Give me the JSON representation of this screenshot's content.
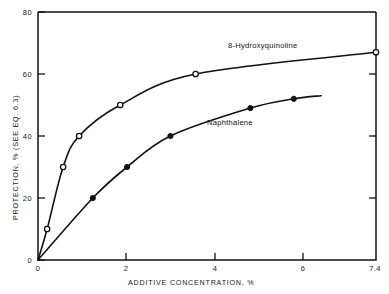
{
  "chart_data": {
    "type": "line",
    "title": "",
    "xlabel": "ADDITIVE CONCENTRATION, %",
    "ylabel": "PROTECTION, % (SEE EQ. 6.3)",
    "xlim": [
      0,
      7.4
    ],
    "ylim": [
      0,
      80
    ],
    "grid": false,
    "legend_position": "inline-annotations",
    "xticks": [
      0,
      2,
      4,
      6,
      7.4
    ],
    "xtick_labels": [
      "0",
      "2",
      "4",
      "6",
      "7.4"
    ],
    "yticks": [
      0,
      20,
      40,
      60,
      80
    ],
    "ytick_labels": [
      "0",
      "20",
      "40",
      "60",
      "80"
    ],
    "series": [
      {
        "name": "8-Hydroxyquinoline",
        "marker": "open-circle",
        "label_text": "8-Hydroxyquinoline",
        "x": [
          0,
          0.2,
          0.55,
          0.9,
          1.8,
          3.45,
          7.4
        ],
        "y": [
          0,
          10,
          30,
          40,
          50,
          60,
          67
        ],
        "points": [
          {
            "x": 0.2,
            "y": 10
          },
          {
            "x": 0.55,
            "y": 30
          },
          {
            "x": 0.9,
            "y": 40
          },
          {
            "x": 1.8,
            "y": 50
          },
          {
            "x": 3.45,
            "y": 60
          },
          {
            "x": 7.4,
            "y": 67
          }
        ]
      },
      {
        "name": "Naphthalene",
        "marker": "filled-circle",
        "label_text": "Naphthalene",
        "x": [
          0,
          1.2,
          1.95,
          2.9,
          4.65,
          5.6,
          6.2
        ],
        "y": [
          0,
          20,
          30,
          40,
          49,
          52,
          53
        ],
        "points": [
          {
            "x": 1.2,
            "y": 20
          },
          {
            "x": 1.95,
            "y": 30
          },
          {
            "x": 2.9,
            "y": 40
          },
          {
            "x": 4.65,
            "y": 49
          },
          {
            "x": 5.6,
            "y": 52
          }
        ]
      }
    ]
  },
  "axes": {
    "x_title": "ADDITIVE CONCENTRATION, %",
    "y_title": "PROTECTION, % (SEE EQ. 6.3)",
    "x_tick_0": "0",
    "x_tick_1": "2",
    "x_tick_2": "4",
    "x_tick_3": "6",
    "x_tick_4": "7.4",
    "y_tick_0": "0",
    "y_tick_1": "20",
    "y_tick_2": "40",
    "y_tick_3": "60",
    "y_tick_4": "80"
  },
  "annotations": {
    "series_1_label": "8-Hydroxyquinoline",
    "series_2_label": "Naphthalene"
  }
}
